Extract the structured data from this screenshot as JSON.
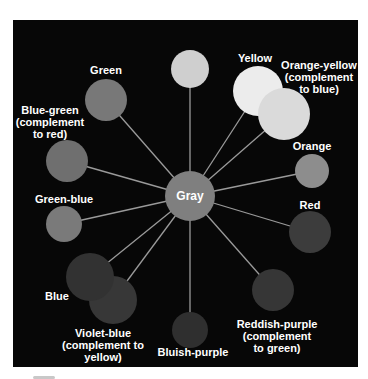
{
  "diagram": {
    "title": "",
    "center": {
      "label": "Gray",
      "x": 190,
      "y": 196,
      "r": 25,
      "color": "#7f7f7f"
    },
    "nodes": [
      {
        "id": "yellow-green",
        "label": "Yellow-green",
        "x": 190,
        "y": 69,
        "r": 19,
        "color": "#cfcfcf",
        "label_x": 190,
        "label_y": 8
      },
      {
        "id": "yellow",
        "label": "Yellow",
        "x": 258,
        "y": 91,
        "r": 25,
        "color": "#ececec",
        "label_x": 255,
        "label_y": 52
      },
      {
        "id": "orange-yellow",
        "label": "Orange-yellow\n(complement\nto blue)",
        "x": 284,
        "y": 114,
        "r": 26,
        "color": "#dadada",
        "label_x": 319,
        "label_y": 59
      },
      {
        "id": "orange",
        "label": "Orange",
        "x": 312,
        "y": 171,
        "r": 17,
        "color": "#8d8d8d",
        "label_x": 312,
        "label_y": 140
      },
      {
        "id": "red",
        "label": "Red",
        "x": 310,
        "y": 232,
        "r": 21,
        "color": "#3c3c3c",
        "label_x": 310,
        "label_y": 199
      },
      {
        "id": "reddish-purple",
        "label": "Reddish-purple\n(complement\nto green)",
        "x": 273,
        "y": 290,
        "r": 21,
        "color": "#363636",
        "label_x": 277,
        "label_y": 318
      },
      {
        "id": "bluish-purple",
        "label": "Bluish-purple",
        "x": 190,
        "y": 330,
        "r": 18,
        "color": "#2f2f2f",
        "label_x": 193,
        "label_y": 346
      },
      {
        "id": "violet-blue",
        "label": "Violet-blue\n(complement to\nyellow)",
        "x": 113,
        "y": 300,
        "r": 24,
        "color": "#373737",
        "label_x": 103,
        "label_y": 327
      },
      {
        "id": "blue",
        "label": "Blue",
        "x": 90,
        "y": 277,
        "r": 24,
        "color": "#323232",
        "label_x": 57,
        "label_y": 290
      },
      {
        "id": "green-blue",
        "label": "Green-blue",
        "x": 64,
        "y": 224,
        "r": 18,
        "color": "#7a7a7a",
        "label_x": 64,
        "label_y": 193
      },
      {
        "id": "blue-green",
        "label": "Blue-green\n(complement\nto red)",
        "x": 67,
        "y": 161,
        "r": 21,
        "color": "#6f6f6f",
        "label_x": 50,
        "label_y": 104
      },
      {
        "id": "green",
        "label": "Green",
        "x": 106,
        "y": 100,
        "r": 21,
        "color": "#787878",
        "label_x": 106,
        "label_y": 64
      }
    ],
    "colors": {
      "background": "#070707",
      "page": "#ffffff",
      "spoke": "#9a9a9a",
      "text": "#ffffff"
    }
  }
}
